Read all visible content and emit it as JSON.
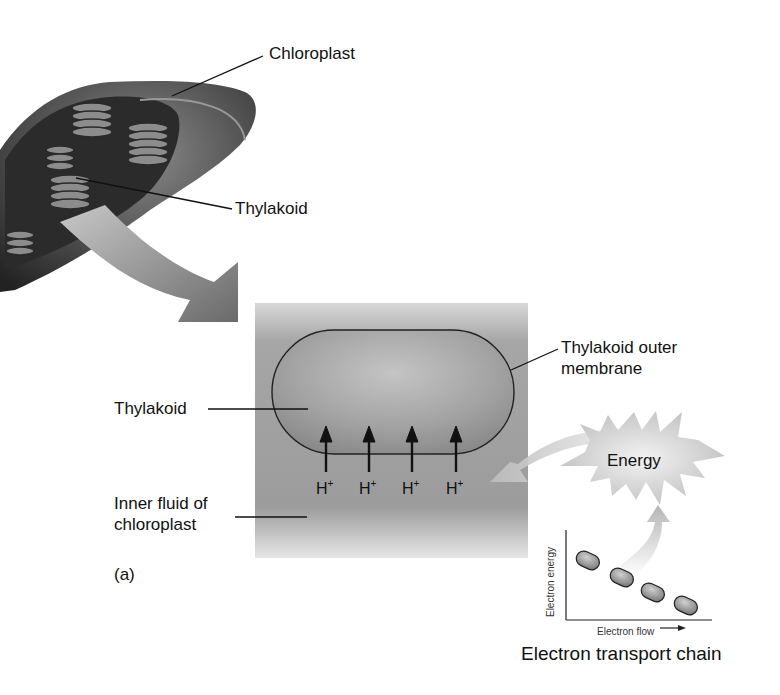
{
  "figure": {
    "panel_label": "(a)",
    "labels": {
      "chloroplast": "Chloroplast",
      "thylakoid_top": "Thylakoid",
      "thylakoid_left": "Thylakoid",
      "outer_membrane_line1": "Thylakoid outer",
      "outer_membrane_line2": "membrane",
      "inner_fluid_line1": "Inner fluid of",
      "inner_fluid_line2": "chloroplast",
      "energy": "Energy",
      "etc_title": "Electron transport chain",
      "axis_y": "Electron energy",
      "axis_x": "Electron flow"
    },
    "protons": [
      {
        "base": "H",
        "charge": "+"
      },
      {
        "base": "H",
        "charge": "+"
      },
      {
        "base": "H",
        "charge": "+"
      },
      {
        "base": "H",
        "charge": "+"
      }
    ],
    "colors": {
      "chloroplast_dark": "#2e2e2e",
      "chloroplast_mid": "#6a6a6a",
      "fluid_gray": "#9a9a9a",
      "thylakoid_fill": "#a8a8a8",
      "arrow_gray": "#7a7a7a",
      "energy_burst": "#d4d4d4"
    }
  }
}
